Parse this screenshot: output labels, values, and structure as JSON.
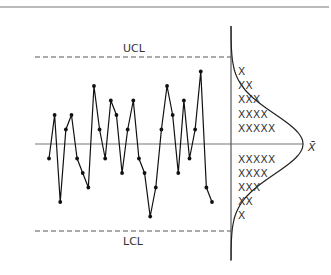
{
  "chart_data": {
    "type": "line",
    "title": "",
    "xlabel": "",
    "ylabel": "",
    "center_label": "X̄",
    "ucl_label": "UCL",
    "lcl_label": "LCL",
    "center_value": 0,
    "ucl_value": 6,
    "lcl_value": -6,
    "ylim": [
      -6,
      6
    ],
    "grid": false,
    "x": [
      1,
      2,
      3,
      4,
      5,
      6,
      7,
      8,
      9,
      10,
      11,
      12,
      13,
      14,
      15,
      16,
      17,
      18,
      19,
      20,
      21,
      22,
      23,
      24,
      25,
      26,
      27,
      28,
      29,
      30
    ],
    "values": [
      -1,
      2,
      -4,
      1,
      2,
      -1,
      -2,
      -3,
      4,
      1,
      -1,
      3,
      2,
      -2,
      1,
      3,
      -1,
      -2,
      -5,
      -3,
      1,
      4,
      2,
      -2,
      3,
      -1,
      1,
      5,
      -3,
      -4
    ],
    "histogram": {
      "orientation": "horizontal",
      "rows": [
        "X",
        "XX",
        "XXX",
        "XXXX",
        "XXXXX",
        "XXXXX",
        "XXXX",
        "XXX",
        "XX",
        "X"
      ],
      "counts": [
        1,
        2,
        3,
        4,
        5,
        5,
        4,
        3,
        2,
        1
      ]
    },
    "distribution_curve": "normal"
  }
}
